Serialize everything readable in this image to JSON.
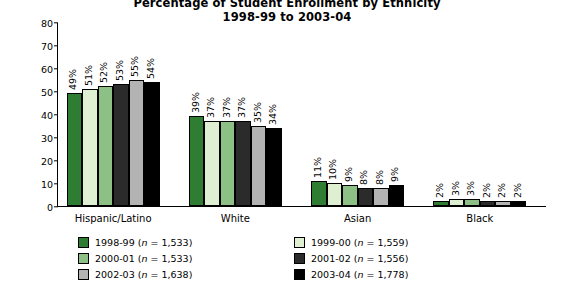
{
  "title": {
    "line1": "Percentage of Student Enrollment by Ethnicity",
    "line2": "1998-99 to 2003-04"
  },
  "chart_data": {
    "type": "bar",
    "title": "Percentage of Student Enrollment by Ethnicity 1998-99 to 2003-04",
    "xlabel": "",
    "ylabel": "Percentage of Students",
    "ylim": [
      0,
      80
    ],
    "yticks": [
      0,
      10,
      20,
      30,
      40,
      50,
      60,
      70,
      80
    ],
    "grid": false,
    "legend_position": "bottom",
    "categories": [
      "Hispanic/Latino",
      "White",
      "Asian",
      "Black"
    ],
    "series": [
      {
        "name": "1998-99",
        "n": "1,533",
        "legend_label": "1998-99 (n = 1,533)",
        "color": "#2e7d32",
        "values": [
          49,
          39,
          11,
          2
        ],
        "labels": [
          "49%",
          "39%",
          "11%",
          "2%"
        ]
      },
      {
        "name": "1999-00",
        "n": "1,559",
        "legend_label": "1999-00 (n = 1,559)",
        "color": "#dff0d2",
        "values": [
          51,
          37,
          10,
          3
        ],
        "labels": [
          "51%",
          "37%",
          "10%",
          "3%"
        ]
      },
      {
        "name": "2000-01",
        "n": "1,533",
        "legend_label": "2000-01 (n = 1,533)",
        "color": "#8cc084",
        "values": [
          52,
          37,
          9,
          3
        ],
        "labels": [
          "52%",
          "37%",
          "9%",
          "3%"
        ]
      },
      {
        "name": "2001-02",
        "n": "1,556",
        "legend_label": "2001-02 (n = 1,556)",
        "color": "#2b2b2b",
        "values": [
          53,
          37,
          8,
          2
        ],
        "labels": [
          "53%",
          "37%",
          "8%",
          "2%"
        ]
      },
      {
        "name": "2002-03",
        "n": "1,638",
        "legend_label": "2002-03 (n = 1,638)",
        "color": "#b3b3b3",
        "values": [
          55,
          35,
          8,
          2
        ],
        "labels": [
          "55%",
          "35%",
          "8%",
          "2%"
        ]
      },
      {
        "name": "2003-04",
        "n": "1,778",
        "legend_label": "2003-04 (n = 1,778)",
        "color": "#000000",
        "values": [
          54,
          34,
          9,
          2
        ],
        "labels": [
          "54%",
          "34%",
          "9%",
          "2%"
        ]
      }
    ]
  }
}
